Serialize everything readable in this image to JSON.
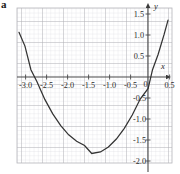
{
  "figure": {
    "label": "a",
    "background": "#ffffff",
    "grid_minor_color": "#d8d8dc",
    "grid_major_color": "#a9a9b0",
    "axis_color": "#4a4a4a",
    "curve_color": "#333333"
  },
  "chart_data": {
    "type": "line",
    "title": "",
    "xlabel": "x",
    "ylabel": "y",
    "xlim": [
      -3.3,
      0.6
    ],
    "ylim": [
      -2.45,
      1.62
    ],
    "grid": true,
    "legend": false,
    "x_ticks": [
      "-3.0",
      "-2.5",
      "-2.0",
      "-1.5",
      "-1.0",
      "-0.5",
      "0",
      "0.5"
    ],
    "x_tick_values": [
      -3.0,
      -2.5,
      -2.0,
      -1.5,
      -1.0,
      -0.5,
      0,
      0.5
    ],
    "y_ticks": [
      "1.5",
      "1.0",
      "0.5",
      "-0.5",
      "-1.0",
      "-1.5",
      "-2.0"
    ],
    "y_tick_values": [
      1.5,
      1.0,
      0.5,
      -0.5,
      -1.0,
      -1.5,
      -2.0
    ],
    "series": [
      {
        "name": "parabola",
        "equation": "y = 0.85(x + 1.42)^2 - 2.2",
        "vertex": [
          -1.42,
          -2.2
        ],
        "roots": [
          -2.95,
          0.11
        ],
        "y_intercept": -0.49,
        "x": [
          -3.25,
          -3.1,
          -2.95,
          -2.8,
          -2.6,
          -2.4,
          -2.2,
          -2.0,
          -1.8,
          -1.6,
          -1.42,
          -1.2,
          -1.0,
          -0.8,
          -0.6,
          -0.4,
          -0.2,
          0.0,
          0.11,
          0.25,
          0.4,
          0.5
        ],
        "y": [
          0.98,
          0.62,
          0.0,
          -0.31,
          -0.78,
          -1.16,
          -1.47,
          -1.71,
          -1.88,
          -1.99,
          -2.2,
          -2.16,
          -2.03,
          -1.82,
          -1.54,
          -1.19,
          -0.77,
          -0.49,
          0.0,
          0.4,
          0.92,
          1.3
        ]
      }
    ]
  }
}
